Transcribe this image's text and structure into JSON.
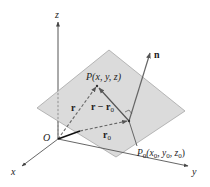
{
  "diagram": {
    "axes": {
      "z_label": "z",
      "x_label": "x",
      "y_label": "y",
      "origin_label": "O"
    },
    "points": {
      "P": {
        "name": "P",
        "coords": "(x, y, z)"
      },
      "P0": {
        "name": "P",
        "sub": "0",
        "coords_parts": [
          "(x",
          "0",
          ", y",
          "0",
          ", z",
          "0",
          ")"
        ]
      }
    },
    "vectors": {
      "r": "r",
      "r_minus_r0": {
        "main": "r − r",
        "sub": "0"
      },
      "r0": {
        "main": "r",
        "sub": "0"
      },
      "n": "n"
    },
    "colors": {
      "plane_fill": "#d9d9d9",
      "plane_stroke": "#9a9a9a",
      "axis": "#555555",
      "vector_solid": "#555555",
      "vector_dashed": "#666666",
      "r0_segment": "#111111"
    }
  }
}
